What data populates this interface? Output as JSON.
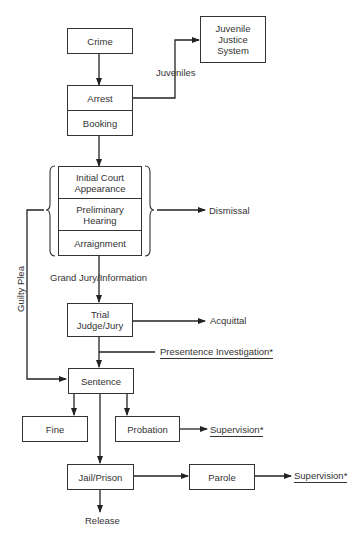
{
  "diagram": {
    "type": "flowchart",
    "nodes": {
      "crime": "Crime",
      "juvenile_system": "Juvenile\nJustice\nSystem",
      "arrest": "Arrest",
      "booking": "Booking",
      "initial_court": "Initial Court\nAppearance",
      "preliminary_hearing": "Preliminary\nHearing",
      "arraignment": "Arraignment",
      "trial": "Trial\nJudge/Jury",
      "sentence": "Sentence",
      "fine": "Fine",
      "probation": "Probation",
      "jail_prison": "Jail/Prison",
      "parole": "Parole"
    },
    "labels": {
      "juveniles": "Juveniles",
      "dismissal": "Dismissal",
      "guilty_plea": "Guilty Plea",
      "grand_jury": "Grand Jury/Information",
      "acquittal": "Acquittal",
      "presentence": "Presentence Investigation*",
      "supervision_probation": "Supervision*",
      "supervision_parole": "Supervision*",
      "release": "Release"
    },
    "edges": [
      {
        "from": "Crime",
        "to": "Arrest"
      },
      {
        "from": "Arrest",
        "to": "Juvenile Justice System",
        "label": "Juveniles"
      },
      {
        "from": "Booking",
        "to": "Initial Court Appearance"
      },
      {
        "from": "Pretrial group",
        "to": "Dismissal"
      },
      {
        "from": "Pretrial group",
        "to": "Sentence",
        "label": "Guilty Plea"
      },
      {
        "from": "Arraignment",
        "to": "Trial",
        "label": "Grand Jury/Information"
      },
      {
        "from": "Trial",
        "to": "Acquittal"
      },
      {
        "from": "Trial",
        "to": "Sentence",
        "side": "Presentence Investigation*"
      },
      {
        "from": "Sentence",
        "to": "Fine"
      },
      {
        "from": "Sentence",
        "to": "Probation"
      },
      {
        "from": "Sentence",
        "to": "Jail/Prison"
      },
      {
        "from": "Probation",
        "to": "Supervision*"
      },
      {
        "from": "Jail/Prison",
        "to": "Parole"
      },
      {
        "from": "Parole",
        "to": "Supervision*"
      },
      {
        "from": "Jail/Prison",
        "to": "Release"
      }
    ]
  }
}
